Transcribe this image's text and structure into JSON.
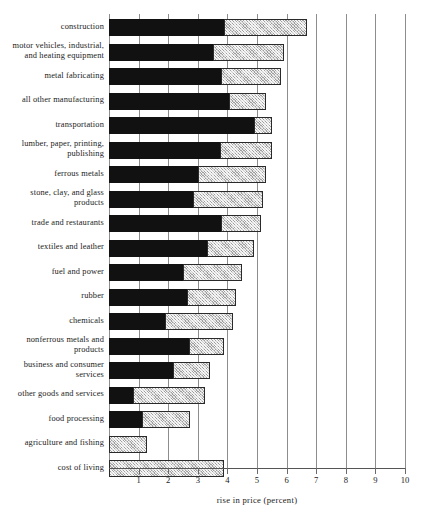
{
  "chart_data": {
    "type": "bar",
    "orientation": "horizontal",
    "stacked": true,
    "title": "",
    "xlabel": "rise in price (percent)",
    "ylabel": "",
    "xlim": [
      0,
      10
    ],
    "xticks": [
      1,
      2,
      3,
      4,
      5,
      6,
      7,
      8,
      9,
      10
    ],
    "xtick_labels": [
      "1",
      "2",
      "3",
      "4",
      "5",
      "6",
      "7",
      "8",
      "9",
      "10"
    ],
    "grid": "vertical",
    "legend": "none",
    "series": [
      {
        "name": "dark-segment",
        "color": "#111111"
      },
      {
        "name": "light-segment",
        "color": "#cfcfcf"
      }
    ],
    "categories": [
      "construction",
      "motor vehicles, industrial, and heating equipment",
      "metal fabricating",
      "all other manufacturing",
      "transportation",
      "lumber, paper, printing, publishing",
      "ferrous metals",
      "stone, clay, and glass products",
      "trade and restaurants",
      "textiles and leather",
      "fuel and power",
      "rubber",
      "chemicals",
      "nonferrous metals and products",
      "business and consumer services",
      "other goods and services",
      "food processing",
      "agriculture and fishing",
      "cost of living"
    ],
    "rows": [
      {
        "label_lines": [
          "construction"
        ],
        "dark": 3.9,
        "total": 6.7
      },
      {
        "label_lines": [
          "motor vehicles, industrial,",
          "and heating equipment"
        ],
        "dark": 3.5,
        "total": 5.9
      },
      {
        "label_lines": [
          "metal fabricating"
        ],
        "dark": 3.8,
        "total": 5.8
      },
      {
        "label_lines": [
          "all other manufacturing"
        ],
        "dark": 4.05,
        "total": 5.3
      },
      {
        "label_lines": [
          "transportation"
        ],
        "dark": 4.9,
        "total": 5.5
      },
      {
        "label_lines": [
          "lumber, paper, printing,",
          "publishing"
        ],
        "dark": 3.75,
        "total": 5.5
      },
      {
        "label_lines": [
          "ferrous metals"
        ],
        "dark": 3.0,
        "total": 5.3
      },
      {
        "label_lines": [
          "stone, clay, and glass",
          "products"
        ],
        "dark": 2.85,
        "total": 5.2
      },
      {
        "label_lines": [
          "trade and restaurants"
        ],
        "dark": 3.8,
        "total": 5.15
      },
      {
        "label_lines": [
          "textiles and leather"
        ],
        "dark": 3.3,
        "total": 4.9
      },
      {
        "label_lines": [
          "fuel and power"
        ],
        "dark": 2.5,
        "total": 4.5
      },
      {
        "label_lines": [
          "rubber"
        ],
        "dark": 2.65,
        "total": 4.3
      },
      {
        "label_lines": [
          "chemicals"
        ],
        "dark": 1.9,
        "total": 4.2
      },
      {
        "label_lines": [
          "nonferrous metals and",
          "products"
        ],
        "dark": 2.7,
        "total": 3.9
      },
      {
        "label_lines": [
          "business and consumer",
          "services"
        ],
        "dark": 2.15,
        "total": 3.4
      },
      {
        "label_lines": [
          "other goods and services"
        ],
        "dark": 0.8,
        "total": 3.25
      },
      {
        "label_lines": [
          "food processing"
        ],
        "dark": 1.1,
        "total": 2.75
      },
      {
        "label_lines": [
          "agriculture and fishing"
        ],
        "dark": 0,
        "total": 1.3
      },
      {
        "label_lines": [
          "cost of living"
        ],
        "dark": 0,
        "total": 3.9
      }
    ]
  }
}
